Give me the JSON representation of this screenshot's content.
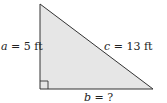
{
  "diagram": {
    "type": "right-triangle",
    "fill_color": "#e6e6e6",
    "stroke_color": "#333333",
    "vertices": {
      "top": [
        40,
        4
      ],
      "right_angle": [
        40,
        89
      ],
      "right": [
        153,
        89
      ]
    },
    "labels": {
      "a": {
        "var": "a",
        "text": " = 5 ft"
      },
      "c": {
        "var": "c",
        "text": " = 13 ft"
      },
      "b": {
        "var": "b",
        "text": " = ?"
      }
    }
  }
}
